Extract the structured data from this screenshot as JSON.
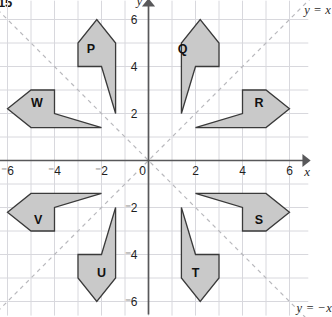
{
  "figure": {
    "tag": "15",
    "background_color": "#ffffff",
    "grid_color": "#d8d8dd",
    "axis_color": "#58585a",
    "shape_fill": "#c9c9c9",
    "shape_stroke": "#3a3a3a",
    "diagonal_color": "#b9b9bd"
  },
  "axes": {
    "x_axis_label": "x",
    "y_axis_label": "y",
    "origin_label": "0",
    "x_ticks": [
      "⁻6",
      "⁻4",
      "⁻2",
      "2",
      "4",
      "6"
    ],
    "x_tick_values": [
      -6,
      -4,
      -2,
      2,
      4,
      6
    ],
    "y_ticks": [
      "6",
      "4",
      "2",
      "⁻2",
      "⁻4",
      "⁻6"
    ],
    "y_tick_values": [
      6,
      4,
      2,
      -2,
      -4,
      -6
    ],
    "x_range": [
      -6.6,
      6.8
    ],
    "y_range": [
      -6.6,
      6.8
    ],
    "grid_step": 1
  },
  "diagonals": [
    {
      "name": "y = x",
      "label": "y = x",
      "style": "dashed"
    },
    {
      "name": "y = -x",
      "label": "y = −x",
      "style": "dashed"
    }
  ],
  "chart_data": {
    "type": "scatter",
    "title": "",
    "xlabel": "x",
    "ylabel": "y",
    "xlim": [
      -6.6,
      6.8
    ],
    "ylim": [
      -6.6,
      6.8
    ],
    "grid": true,
    "legend": "none",
    "annotations": [
      "y = x",
      "y = −x"
    ],
    "shapes": [
      {
        "name": "P",
        "label": "P",
        "label_xy": [
          -2.45,
          4.75
        ],
        "points": [
          [
            -3.0,
            4.0
          ],
          [
            -3.0,
            5.0
          ],
          [
            -2.2,
            6.0
          ],
          [
            -1.4,
            5.0
          ],
          [
            -1.4,
            2.0
          ],
          [
            -2.0,
            4.0
          ]
        ]
      },
      {
        "name": "Q",
        "label": "Q",
        "label_xy": [
          1.45,
          4.75
        ],
        "points": [
          [
            3.0,
            4.0
          ],
          [
            3.0,
            5.0
          ],
          [
            2.2,
            6.0
          ],
          [
            1.4,
            5.0
          ],
          [
            1.4,
            2.0
          ],
          [
            2.0,
            4.0
          ]
        ]
      },
      {
        "name": "R",
        "label": "R",
        "label_xy": [
          4.7,
          2.45
        ],
        "points": [
          [
            4.0,
            3.0
          ],
          [
            5.0,
            3.0
          ],
          [
            6.0,
            2.2
          ],
          [
            5.0,
            1.4
          ],
          [
            2.0,
            1.4
          ],
          [
            4.0,
            2.0
          ]
        ]
      },
      {
        "name": "S",
        "label": "S",
        "label_xy": [
          4.7,
          -2.5
        ],
        "points": [
          [
            4.0,
            -3.0
          ],
          [
            5.0,
            -3.0
          ],
          [
            6.0,
            -2.2
          ],
          [
            5.0,
            -1.4
          ],
          [
            2.0,
            -1.4
          ],
          [
            4.0,
            -2.0
          ]
        ]
      },
      {
        "name": "T",
        "label": "T",
        "label_xy": [
          2.0,
          -4.75
        ],
        "points": [
          [
            3.0,
            -4.0
          ],
          [
            3.0,
            -5.0
          ],
          [
            2.2,
            -6.0
          ],
          [
            1.4,
            -5.0
          ],
          [
            1.4,
            -2.0
          ],
          [
            2.0,
            -4.0
          ]
        ]
      },
      {
        "name": "U",
        "label": "U",
        "label_xy": [
          -2.0,
          -4.75
        ],
        "points": [
          [
            -3.0,
            -4.0
          ],
          [
            -3.0,
            -5.0
          ],
          [
            -2.2,
            -6.0
          ],
          [
            -1.4,
            -5.0
          ],
          [
            -1.4,
            -2.0
          ],
          [
            -2.0,
            -4.0
          ]
        ]
      },
      {
        "name": "V",
        "label": "V",
        "label_xy": [
          -4.7,
          -2.5
        ],
        "points": [
          [
            -4.0,
            -3.0
          ],
          [
            -5.0,
            -3.0
          ],
          [
            -6.0,
            -2.2
          ],
          [
            -5.0,
            -1.4
          ],
          [
            -2.0,
            -1.4
          ],
          [
            -4.0,
            -2.0
          ]
        ]
      },
      {
        "name": "W",
        "label": "W",
        "label_xy": [
          -4.75,
          2.45
        ],
        "points": [
          [
            -4.0,
            3.0
          ],
          [
            -5.0,
            3.0
          ],
          [
            -6.0,
            2.2
          ],
          [
            -5.0,
            1.4
          ],
          [
            -2.0,
            1.4
          ],
          [
            -4.0,
            2.0
          ]
        ]
      }
    ]
  }
}
